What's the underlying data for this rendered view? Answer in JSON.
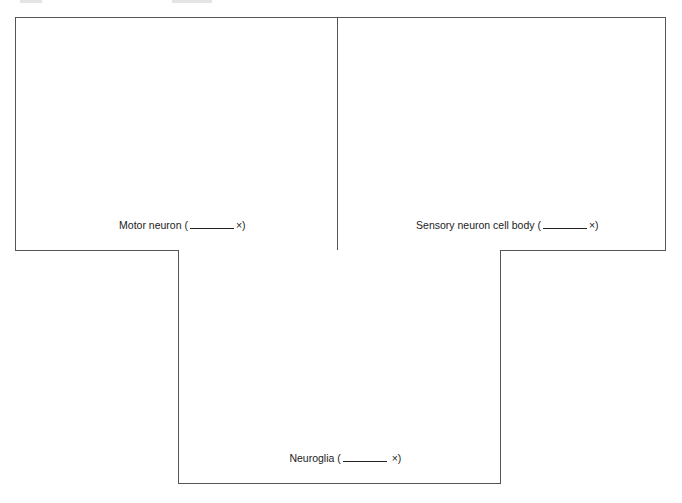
{
  "panels": [
    {
      "id": "motor-neuron",
      "label_prefix": "Motor neuron (",
      "label_suffix": "×)",
      "blank_width": 44
    },
    {
      "id": "sensory-neuron-cell-body",
      "label_prefix": "Sensory neuron cell body (",
      "label_suffix": "×)",
      "blank_width": 44
    },
    {
      "id": "neuroglia",
      "label_prefix": "Neuroglia (",
      "label_suffix": " ×)",
      "blank_width": 44
    }
  ],
  "colors": {
    "border": "#555555",
    "text": "#222222",
    "background": "#ffffff"
  }
}
